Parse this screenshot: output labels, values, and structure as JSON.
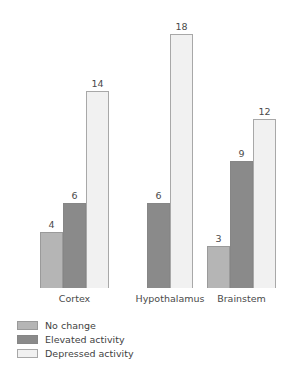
{
  "chart_data": {
    "type": "bar",
    "title": "",
    "subtitle": "",
    "xlabel": "",
    "ylabel": "",
    "grid": false,
    "legend_position": "bottom-left",
    "axis_visible": false,
    "value_labels": true,
    "ylim": [
      0,
      18
    ],
    "categories": [
      "Cortex",
      "Hypothalamus",
      "Brainstem"
    ],
    "series": [
      {
        "name": "No change",
        "color": "#b5b5b5",
        "border": "#9a9a9a",
        "values": [
          4,
          null,
          3
        ]
      },
      {
        "name": "Elevated activity",
        "color": "#8a8a8a",
        "border": "#868686",
        "values": [
          6,
          6,
          9
        ]
      },
      {
        "name": "Depressed activity",
        "color": "#f1f1f1",
        "border": "#a8a8a8",
        "values": [
          14,
          18,
          12
        ]
      }
    ]
  },
  "legend": {
    "items": [
      {
        "label": "No change",
        "color": "#b5b5b5",
        "border": "#9a9a9a"
      },
      {
        "label": "Elevated activity",
        "color": "#8a8a8a",
        "border": "#868686"
      },
      {
        "label": "Depressed activity",
        "color": "#f1f1f1",
        "border": "#a8a8a8"
      }
    ]
  },
  "axis": {
    "category_labels": [
      "Cortex",
      "Hypothalamus",
      "Brainstem"
    ]
  },
  "bar_values_text": {
    "cortex": [
      "4",
      "6",
      "14"
    ],
    "hypothalamus": [
      "6",
      "18"
    ],
    "brainstem": [
      "3",
      "9",
      "12"
    ]
  }
}
